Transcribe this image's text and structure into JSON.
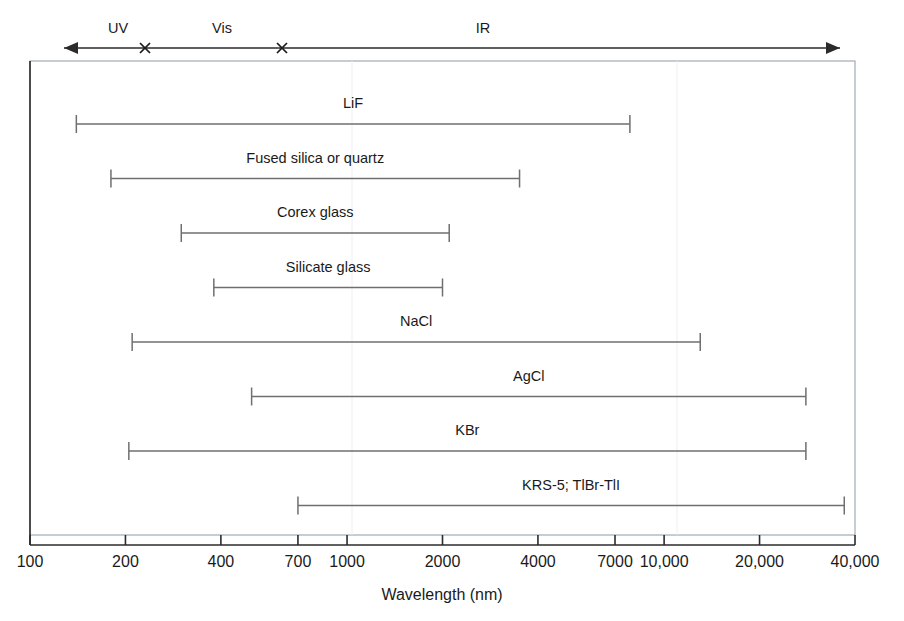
{
  "chart_data": {
    "type": "bar",
    "title": "",
    "subtitle": "",
    "xlabel": "Wavelength (nm)",
    "ylabel": "",
    "xscale": "log",
    "xlim": [
      100,
      40000
    ],
    "xticks": [
      100,
      200,
      400,
      700,
      1000,
      2000,
      4000,
      7000,
      10000,
      20000,
      40000
    ],
    "xticklabels": [
      "100",
      "200",
      "400",
      "700",
      "1000",
      "2000",
      "4000",
      "7000",
      "10,000",
      "20,000",
      "40,000"
    ],
    "grid": false,
    "legend_position": "none",
    "orientation": "horizontal",
    "categories": [
      "LiF",
      "Fused silica or quartz",
      "Corex glass",
      "Silicate glass",
      "NaCl",
      "AgCl",
      "KBr",
      "KRS-5; TlBr-TlI"
    ],
    "bars": [
      {
        "label": "LiF",
        "start": 140,
        "end": 7800
      },
      {
        "label": "Fused silica or quartz",
        "start": 180,
        "end": 3500
      },
      {
        "label": "Corex glass",
        "start": 300,
        "end": 2100
      },
      {
        "label": "Silicate glass",
        "start": 380,
        "end": 2000
      },
      {
        "label": "NaCl",
        "start": 210,
        "end": 13000
      },
      {
        "label": "AgCl",
        "start": 500,
        "end": 28000
      },
      {
        "label": "KBr",
        "start": 205,
        "end": 28000
      },
      {
        "label": "KRS-5; TlBr-TlI",
        "start": 700,
        "end": 37000
      }
    ],
    "spectral_regions": {
      "axis_label": "spectral-region-axis",
      "boundaries": [
        380,
        700
      ],
      "regions": [
        {
          "label": "UV",
          "center": 195
        },
        {
          "label": "Vis",
          "center": 515
        },
        {
          "label": "IR",
          "center": 5500
        }
      ]
    }
  },
  "figure": {
    "colors": {
      "bar": "#6f6f6f",
      "axis": "#2b2b2b",
      "border": "#9aa3ae",
      "text": "#1a1a1a",
      "background": "#ffffff"
    }
  }
}
